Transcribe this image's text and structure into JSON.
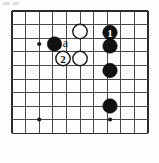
{
  "figure": {
    "kind": "go-board-diagram",
    "caption": "",
    "board": {
      "cols": 11,
      "rows": 10,
      "left": 12,
      "top": 11,
      "spacing": 13.6,
      "line_color": "#4a4a4a",
      "edge_color": "#2b2b2b",
      "background": "#fdfdfd",
      "stone_radius": 7.2
    },
    "star_points": [
      {
        "name": "star-point-upper-left",
        "x": 39.2,
        "y": 44.0
      },
      {
        "name": "star-point-lower-left",
        "x": 39.2,
        "y": 119.5
      },
      {
        "name": "star-point-lower-right",
        "x": 110.0,
        "y": 119.5
      }
    ],
    "stones": [
      {
        "name": "white-stone-upper",
        "color": "white",
        "x": 80.0,
        "y": 31.5,
        "label": ""
      },
      {
        "name": "black-stone-move-1",
        "color": "black",
        "x": 110.0,
        "y": 32.5,
        "label": "1"
      },
      {
        "name": "black-stone-right-upper",
        "color": "black",
        "x": 110.0,
        "y": 46.0,
        "label": ""
      },
      {
        "name": "black-stone-left",
        "color": "black",
        "x": 54.5,
        "y": 44.0,
        "label": ""
      },
      {
        "name": "white-stone-move-2",
        "color": "white",
        "x": 63.0,
        "y": 58.5,
        "label": "2"
      },
      {
        "name": "white-stone-lower",
        "color": "white",
        "x": 80.0,
        "y": 58.5,
        "label": ""
      },
      {
        "name": "black-stone-right-middle",
        "color": "black",
        "x": 110.0,
        "y": 70.5,
        "label": ""
      },
      {
        "name": "black-stone-right-lower",
        "color": "black",
        "x": 110.0,
        "y": 106.0,
        "label": ""
      }
    ],
    "point_markers": [
      {
        "name": "point-marker-a",
        "letter": "a",
        "x": 65.5,
        "y": 43.0
      }
    ]
  }
}
